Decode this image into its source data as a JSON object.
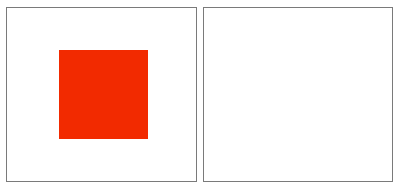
{
  "panels": [
    {
      "id": "left",
      "shapes": [
        {
          "type": "square",
          "color": "#f22a00"
        }
      ]
    },
    {
      "id": "right",
      "shapes": []
    }
  ],
  "colors": {
    "background": "#ffffff",
    "border": "#7a7a7a",
    "square": "#f22a00"
  }
}
